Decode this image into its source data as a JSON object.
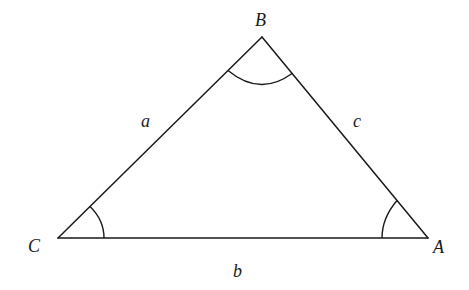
{
  "diagram": {
    "type": "triangle",
    "vertices": {
      "A": {
        "label": "A",
        "x": 428,
        "y": 238
      },
      "B": {
        "label": "B",
        "x": 262,
        "y": 37
      },
      "C": {
        "label": "C",
        "x": 58,
        "y": 238
      }
    },
    "sides": {
      "a": {
        "label": "a",
        "from": "C",
        "to": "B"
      },
      "b": {
        "label": "b",
        "from": "C",
        "to": "A"
      },
      "c": {
        "label": "c",
        "from": "B",
        "to": "A"
      }
    },
    "angle_marks": [
      "A",
      "B",
      "C"
    ],
    "stroke_color": "#1a1a1a",
    "background_color": "#ffffff"
  }
}
